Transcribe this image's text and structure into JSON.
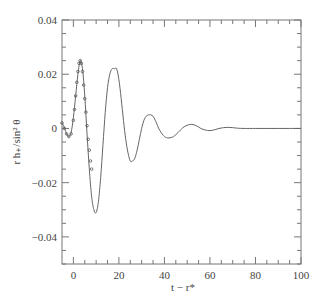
{
  "chart_data": {
    "type": "line",
    "title": "",
    "xlabel": "t − r*",
    "ylabel": "r h₊/sin² θ",
    "xlim": [
      -5,
      100
    ],
    "ylim": [
      -0.05,
      0.04
    ],
    "grid": false,
    "legend": null,
    "x_ticks": [
      0,
      20,
      40,
      60,
      80,
      100
    ],
    "x_tick_labels": [
      "0",
      "20",
      "40",
      "60",
      "80",
      "100"
    ],
    "y_ticks": [
      0.04,
      0.02,
      0,
      -0.02,
      -0.04
    ],
    "y_tick_labels": [
      "0.04",
      "0.02",
      "0",
      "−0.02",
      "−0.04"
    ],
    "series": [
      {
        "name": "waveform (solid line)",
        "style": "solid",
        "x": [
          -5,
          -4,
          -3,
          -2,
          -1,
          0,
          1,
          2,
          3,
          4,
          5,
          6,
          7,
          8,
          9,
          10,
          11,
          12,
          13,
          14,
          15,
          16,
          17,
          18,
          19,
          20,
          21,
          22,
          23,
          24,
          25,
          26,
          27,
          28,
          29,
          30,
          31,
          32,
          33,
          34,
          35,
          36,
          37,
          38,
          40,
          42,
          44,
          46,
          48,
          50,
          52,
          54,
          56,
          58,
          60,
          62,
          64,
          66,
          68,
          70,
          72,
          75,
          80,
          85,
          90,
          95,
          100
        ],
        "y": [
          0.002,
          0.0005,
          -0.002,
          -0.003,
          -0.0015,
          0.004,
          0.012,
          0.02,
          0.025,
          0.022,
          0.012,
          -0.002,
          -0.015,
          -0.025,
          -0.03,
          -0.031,
          -0.027,
          -0.018,
          -0.006,
          0.006,
          0.015,
          0.02,
          0.022,
          0.022,
          0.022,
          0.018,
          0.011,
          0.003,
          -0.004,
          -0.009,
          -0.012,
          -0.012,
          -0.011,
          -0.008,
          -0.004,
          0.0,
          0.003,
          0.0045,
          0.005,
          0.005,
          0.0045,
          0.003,
          0.001,
          -0.0008,
          -0.003,
          -0.0035,
          -0.003,
          -0.0015,
          0.0002,
          0.0012,
          0.0015,
          0.001,
          0.0,
          -0.0006,
          -0.0008,
          -0.0005,
          0.0,
          0.0003,
          0.0004,
          0.0003,
          0.0001,
          0.0,
          0.0,
          0.0,
          0.0,
          0.0,
          0.0
        ]
      },
      {
        "name": "comparison (dotted markers)",
        "style": "markers",
        "x": [
          -5,
          -4,
          -3,
          -2,
          -1,
          0,
          0.5,
          1,
          1.5,
          2,
          2.5,
          3,
          3.5,
          4,
          4.5,
          5,
          5.5,
          6,
          6.5,
          7,
          7.5,
          8
        ],
        "y": [
          0.002,
          0.0,
          -0.002,
          -0.003,
          -0.002,
          0.003,
          0.007,
          0.012,
          0.017,
          0.021,
          0.024,
          0.025,
          0.024,
          0.021,
          0.016,
          0.011,
          0.006,
          0.001,
          -0.004,
          -0.008,
          -0.012,
          -0.015
        ]
      }
    ]
  }
}
